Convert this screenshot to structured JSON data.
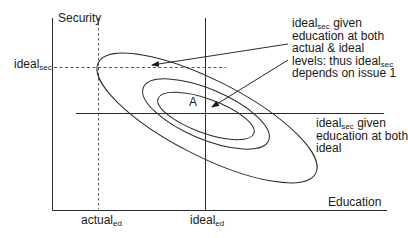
{
  "diagram": {
    "axes": {
      "y_label": "Security",
      "x_label": "Education"
    },
    "y_tick": {
      "base": "ideal",
      "sub": "sec"
    },
    "x_ticks": [
      {
        "base": "actual",
        "sub": "ed"
      },
      {
        "base": "ideal",
        "sub": "ed"
      }
    ],
    "point_label": "A",
    "annotation_top": {
      "line1_base": "ideal",
      "line1_sub": "sec",
      "line1_rest": " given",
      "line2": "education at both",
      "line3": "actual & ideal",
      "line4_pre": "levels: thus ideal",
      "line4_sub": "sec",
      "line5": "depends on issue 1"
    },
    "annotation_right": {
      "line1_base": "ideal",
      "line1_sub": "sec",
      "line1_rest": " given",
      "line2": "education at both",
      "line3": "ideal"
    },
    "colors": {
      "line": "#2a2a2a",
      "dotted": "#555555",
      "background": "#ffffff"
    }
  }
}
